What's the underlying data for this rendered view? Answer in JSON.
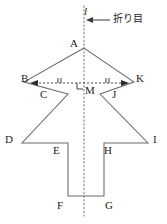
{
  "figure": {
    "background_color": "#ffffff",
    "stroke_color": "#5a5a5a",
    "text_color": "#222222",
    "fold_line": {
      "label": "l",
      "annotation": "折り目",
      "style": "dotted",
      "x": 84,
      "y_top": 6,
      "y_bottom": 216
    },
    "arrow_annotation": {
      "text": "折り目",
      "points_to": "fold-line"
    },
    "vertex_labels": [
      {
        "name": "A",
        "text": "A",
        "x": 70,
        "y": 38
      },
      {
        "name": "B",
        "text": "B",
        "x": 21,
        "y": 73
      },
      {
        "name": "K",
        "text": "K",
        "x": 136,
        "y": 73
      },
      {
        "name": "C",
        "text": "C",
        "x": 40,
        "y": 89
      },
      {
        "name": "M",
        "text": "M",
        "x": 85,
        "y": 85
      },
      {
        "name": "J",
        "text": "J",
        "x": 112,
        "y": 89
      },
      {
        "name": "D",
        "text": "D",
        "x": 5,
        "y": 134
      },
      {
        "name": "E",
        "text": "E",
        "x": 53,
        "y": 145
      },
      {
        "name": "H",
        "text": "H",
        "x": 104,
        "y": 145
      },
      {
        "name": "I",
        "text": "I",
        "x": 153,
        "y": 134
      },
      {
        "name": "F",
        "text": "F",
        "x": 57,
        "y": 200
      },
      {
        "name": "G",
        "text": "G",
        "x": 105,
        "y": 200
      }
    ],
    "marks": {
      "right_angle_at": "M",
      "equal_tick_segments": [
        "BM",
        "MK"
      ],
      "double_arrow_segment": "BK"
    },
    "outline_points": "A(84,48) B(24,82) C(68,94) D(22,143) E(68,143) F(68,196) G(104,196) H(104,143) I(148,143) J(100,94) K(134,82)"
  }
}
